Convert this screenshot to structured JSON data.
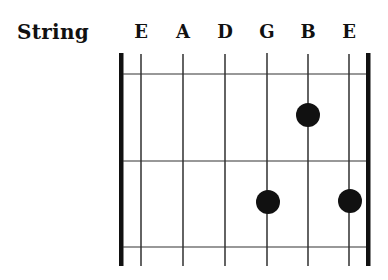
{
  "diagram": {
    "title": "String",
    "strings": [
      {
        "name": "E",
        "x": 141
      },
      {
        "name": "A",
        "x": 183
      },
      {
        "name": "D",
        "x": 225
      },
      {
        "name": "G",
        "x": 267
      },
      {
        "name": "B",
        "x": 308
      },
      {
        "name": "E",
        "x": 349
      }
    ],
    "frets_y": [
      74,
      161,
      247
    ],
    "dots": [
      {
        "string": "B",
        "fret": 1,
        "x": 308,
        "y": 115
      },
      {
        "string": "G",
        "fret": 2,
        "x": 268,
        "y": 202
      },
      {
        "string": "E",
        "fret": 2,
        "x": 350,
        "y": 201
      }
    ],
    "colors": {
      "ink": "#111111",
      "background": "#ffffff"
    }
  }
}
